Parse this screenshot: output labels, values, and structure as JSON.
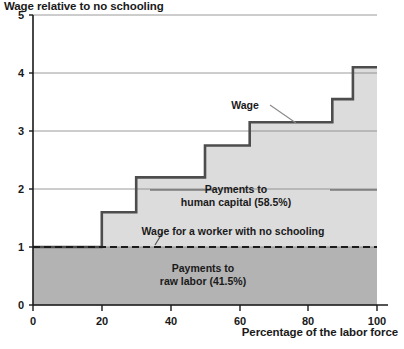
{
  "chart_data": {
    "type": "area",
    "title": "Wage relative to no schooling",
    "xlabel": "Percentage of the labor force",
    "ylabel": "Wage relative to no schooling",
    "xlim": [
      0,
      100
    ],
    "ylim": [
      0,
      5
    ],
    "xticks": [
      "0",
      "20",
      "40",
      "60",
      "80",
      "100"
    ],
    "xtick_values": [
      0,
      20,
      40,
      60,
      80,
      100
    ],
    "yticks": [
      "0",
      "1",
      "2",
      "3",
      "4",
      "5"
    ],
    "ytick_values": [
      0,
      1,
      2,
      3,
      4,
      5
    ],
    "grid": "horizontal",
    "legend": "none",
    "series": [
      {
        "name": "Wage",
        "step_type": "post",
        "x": [
          0,
          20,
          30,
          50,
          63,
          87,
          93,
          100
        ],
        "values": [
          1.0,
          1.6,
          2.2,
          2.75,
          3.15,
          3.55,
          4.1,
          4.1
        ]
      },
      {
        "name": "Wage for a worker with no schooling",
        "style": "dashed-horizontal",
        "value": 1.0
      }
    ],
    "annotations": [
      {
        "id": "wage",
        "text": "Wage",
        "leader_line": true,
        "points_to": "step curve"
      },
      {
        "id": "human_capital",
        "line1": "Payments to",
        "line2": "human capital (58.5%)",
        "percent": "58.5%",
        "region": "area between dashed no-schooling line and wage step curve"
      },
      {
        "id": "raw_labor",
        "line1": "Payments to",
        "line2": "raw labor (41.5%)",
        "percent": "41.5%",
        "region": "area below dashed no-schooling line"
      },
      {
        "id": "no_schooling",
        "text": "Wage for a worker with no schooling",
        "leader_line": true,
        "points_to": "dashed line at y=1"
      }
    ],
    "colors": {
      "fill_raw_labor": "#b3b3b3",
      "fill_human_capital": "#dcdcdc",
      "step_line": "#4d4d4d",
      "axis": "#1a1a1a",
      "grid": "#808080",
      "text": "#1a1a1a"
    }
  }
}
